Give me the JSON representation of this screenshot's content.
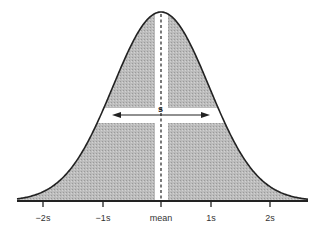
{
  "diagram": {
    "width_label": "s",
    "axis": {
      "ticks": [
        {
          "label": "−2s",
          "x": 43
        },
        {
          "label": "−1s",
          "x": 103
        },
        {
          "label": "mean",
          "x": 161
        },
        {
          "label": "1s",
          "x": 211
        },
        {
          "label": "2s",
          "x": 270
        }
      ]
    },
    "colors": {
      "fill": "#b9b9b9",
      "stroke": "#222222",
      "background": "#ffffff",
      "highlight": "#ffffff"
    },
    "geometry": {
      "center_x": 161,
      "baseline_y": 201,
      "peak_y": 12,
      "sigma_px": 48,
      "axis_start_x": 17,
      "axis_end_x": 308,
      "arrow_y": 115,
      "arrow_left_x": 112,
      "arrow_right_x": 210,
      "band_y_top": 108,
      "band_y_bottom": 123,
      "band_x_left": 155,
      "band_x_right": 168
    }
  }
}
